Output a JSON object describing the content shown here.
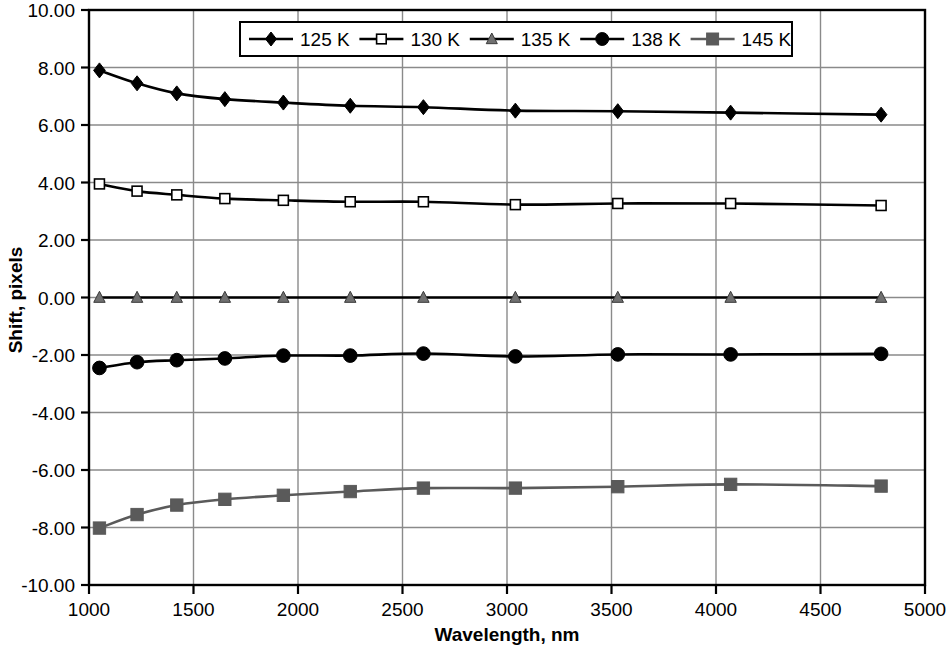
{
  "chart_data": {
    "type": "line",
    "title": "",
    "xlabel": "Wavelength, nm",
    "ylabel": "Shift, pixels",
    "xlim": [
      1000,
      5000
    ],
    "ylim": [
      -10,
      10
    ],
    "xticks": [
      1000,
      1500,
      2000,
      2500,
      3000,
      3500,
      4000,
      4500,
      5000
    ],
    "xtick_labels": [
      "1000",
      "1500",
      "2000",
      "2500",
      "3000",
      "3500",
      "4000",
      "4500",
      "5000"
    ],
    "yticks": [
      10,
      8,
      6,
      4,
      2,
      0,
      -2,
      -4,
      -6,
      -8,
      -10
    ],
    "ytick_labels": [
      "10.00",
      "8.00",
      "6.00",
      "4.00",
      "2.00",
      "0.00",
      "-2.00",
      "-4.00",
      "-6.00",
      "-8.00",
      "-10.00"
    ],
    "grid": true,
    "legend_position": "top-center",
    "x": [
      1050,
      1230,
      1420,
      1650,
      1930,
      2250,
      2600,
      3040,
      3530,
      4070,
      4790
    ],
    "series": [
      {
        "name": "125 K",
        "marker": "filled-diamond",
        "color": "#000000",
        "values": [
          7.9,
          7.45,
          7.1,
          6.9,
          6.78,
          6.67,
          6.62,
          6.5,
          6.48,
          6.43,
          6.36
        ]
      },
      {
        "name": "130 K",
        "marker": "open-square",
        "color": "#000000",
        "values": [
          3.95,
          3.7,
          3.57,
          3.44,
          3.38,
          3.33,
          3.33,
          3.23,
          3.27,
          3.27,
          3.2
        ]
      },
      {
        "name": "135 K",
        "marker": "filled-triangle",
        "color": "#707070",
        "line_color": "#000000",
        "values": [
          0.0,
          0.0,
          0.0,
          0.0,
          0.0,
          0.0,
          0.0,
          0.0,
          0.0,
          0.0,
          0.0
        ]
      },
      {
        "name": "138 K",
        "marker": "filled-circle",
        "color": "#000000",
        "values": [
          -2.45,
          -2.25,
          -2.18,
          -2.12,
          -2.02,
          -2.02,
          -1.95,
          -2.05,
          -1.98,
          -1.98,
          -1.96
        ]
      },
      {
        "name": "145 K",
        "marker": "filled-square",
        "color": "#5a5a5a",
        "values": [
          -8.02,
          -7.55,
          -7.22,
          -7.02,
          -6.88,
          -6.75,
          -6.63,
          -6.63,
          -6.58,
          -6.5,
          -6.56
        ]
      }
    ]
  },
  "axes": {
    "y_title": "Shift, pixels",
    "x_title": "Wavelength, nm"
  },
  "legend": {
    "entries": [
      {
        "label": "125 K"
      },
      {
        "label": "130 K"
      },
      {
        "label": "135 K"
      },
      {
        "label": "138 K"
      },
      {
        "label": "145 K"
      }
    ]
  },
  "colors": {
    "axis": "#000000",
    "grid": "#8a8a8a",
    "plot_background": "#ffffff",
    "gray_marker": "#707070",
    "dark_gray_marker": "#5a5a5a"
  }
}
